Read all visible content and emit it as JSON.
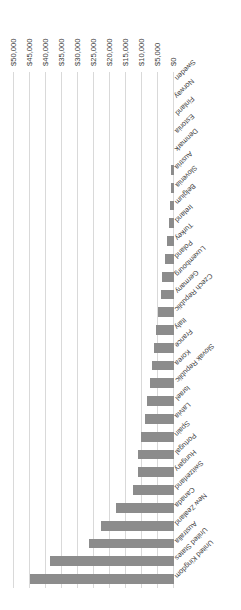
{
  "chart": {
    "type": "bar",
    "orientation": "horizontal",
    "title": "",
    "axis_title": "Cost of tertiary education",
    "bar_color": "#8c8c8c",
    "gridline_color": "#d9d9d9",
    "rotation_degrees": 180
  },
  "chart_data": {
    "type": "bar",
    "title": "",
    "subtitle": "",
    "xlabel": "Cost of tertiary education",
    "ylabel": "",
    "orientation": "horizontal",
    "grid": true,
    "legend": null,
    "xlim": [
      0,
      50000
    ],
    "xticks": [
      0,
      5000,
      10000,
      15000,
      20000,
      25000,
      30000,
      35000,
      40000,
      45000,
      50000
    ],
    "xtick_labels": [
      "$0",
      "$5,000",
      "$10,000",
      "$15,000",
      "$20,000",
      "$25,000",
      "$30,000",
      "$35,000",
      "$40,000",
      "$45,000",
      "$50,000"
    ],
    "categories": [
      "United Kingdom",
      "United States",
      "Australia",
      "New Zealand",
      "Canada",
      "Switzerland",
      "Hungary",
      "Portugal",
      "Spain",
      "Latvia",
      "Israel",
      "Slovak Republic",
      "Korea",
      "France",
      "Italy",
      "Czech Republic",
      "Germany",
      "Luxembourg",
      "Poland",
      "Turkey",
      "Ireland",
      "Belgium",
      "Slovenia",
      "Austria",
      "Denmark",
      "Estonia",
      "Finland",
      "Norway",
      "Sweden"
    ],
    "values": [
      45000,
      38800,
      26500,
      22800,
      18200,
      12800,
      11300,
      11300,
      10200,
      9000,
      8400,
      7600,
      6800,
      6200,
      5600,
      4900,
      4200,
      3600,
      2900,
      2300,
      1700,
      1300,
      1000,
      800,
      0,
      0,
      0,
      0,
      0
    ]
  }
}
